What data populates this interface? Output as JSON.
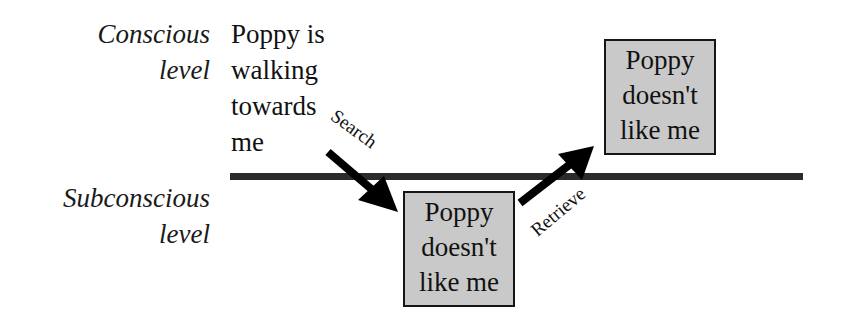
{
  "levels": {
    "conscious": {
      "lines": [
        "Conscious",
        "level"
      ]
    },
    "subconscious": {
      "lines": [
        "Subconscious",
        "level"
      ]
    }
  },
  "conscious_thought": {
    "lines": [
      "Poppy is",
      "walking",
      "towards",
      "me"
    ]
  },
  "memory_boxes": {
    "subconscious": {
      "lines": [
        "Poppy",
        "doesn't",
        "like me"
      ]
    },
    "conscious": {
      "lines": [
        "Poppy",
        "doesn't",
        "like me"
      ]
    }
  },
  "arrows": {
    "search": {
      "label": "Search"
    },
    "retrieve": {
      "label": "Retrieve"
    }
  },
  "colors": {
    "box_fill": "#c9c9c9",
    "box_border": "#151515",
    "divider": "#2b2b2b",
    "arrow": "#000000"
  }
}
